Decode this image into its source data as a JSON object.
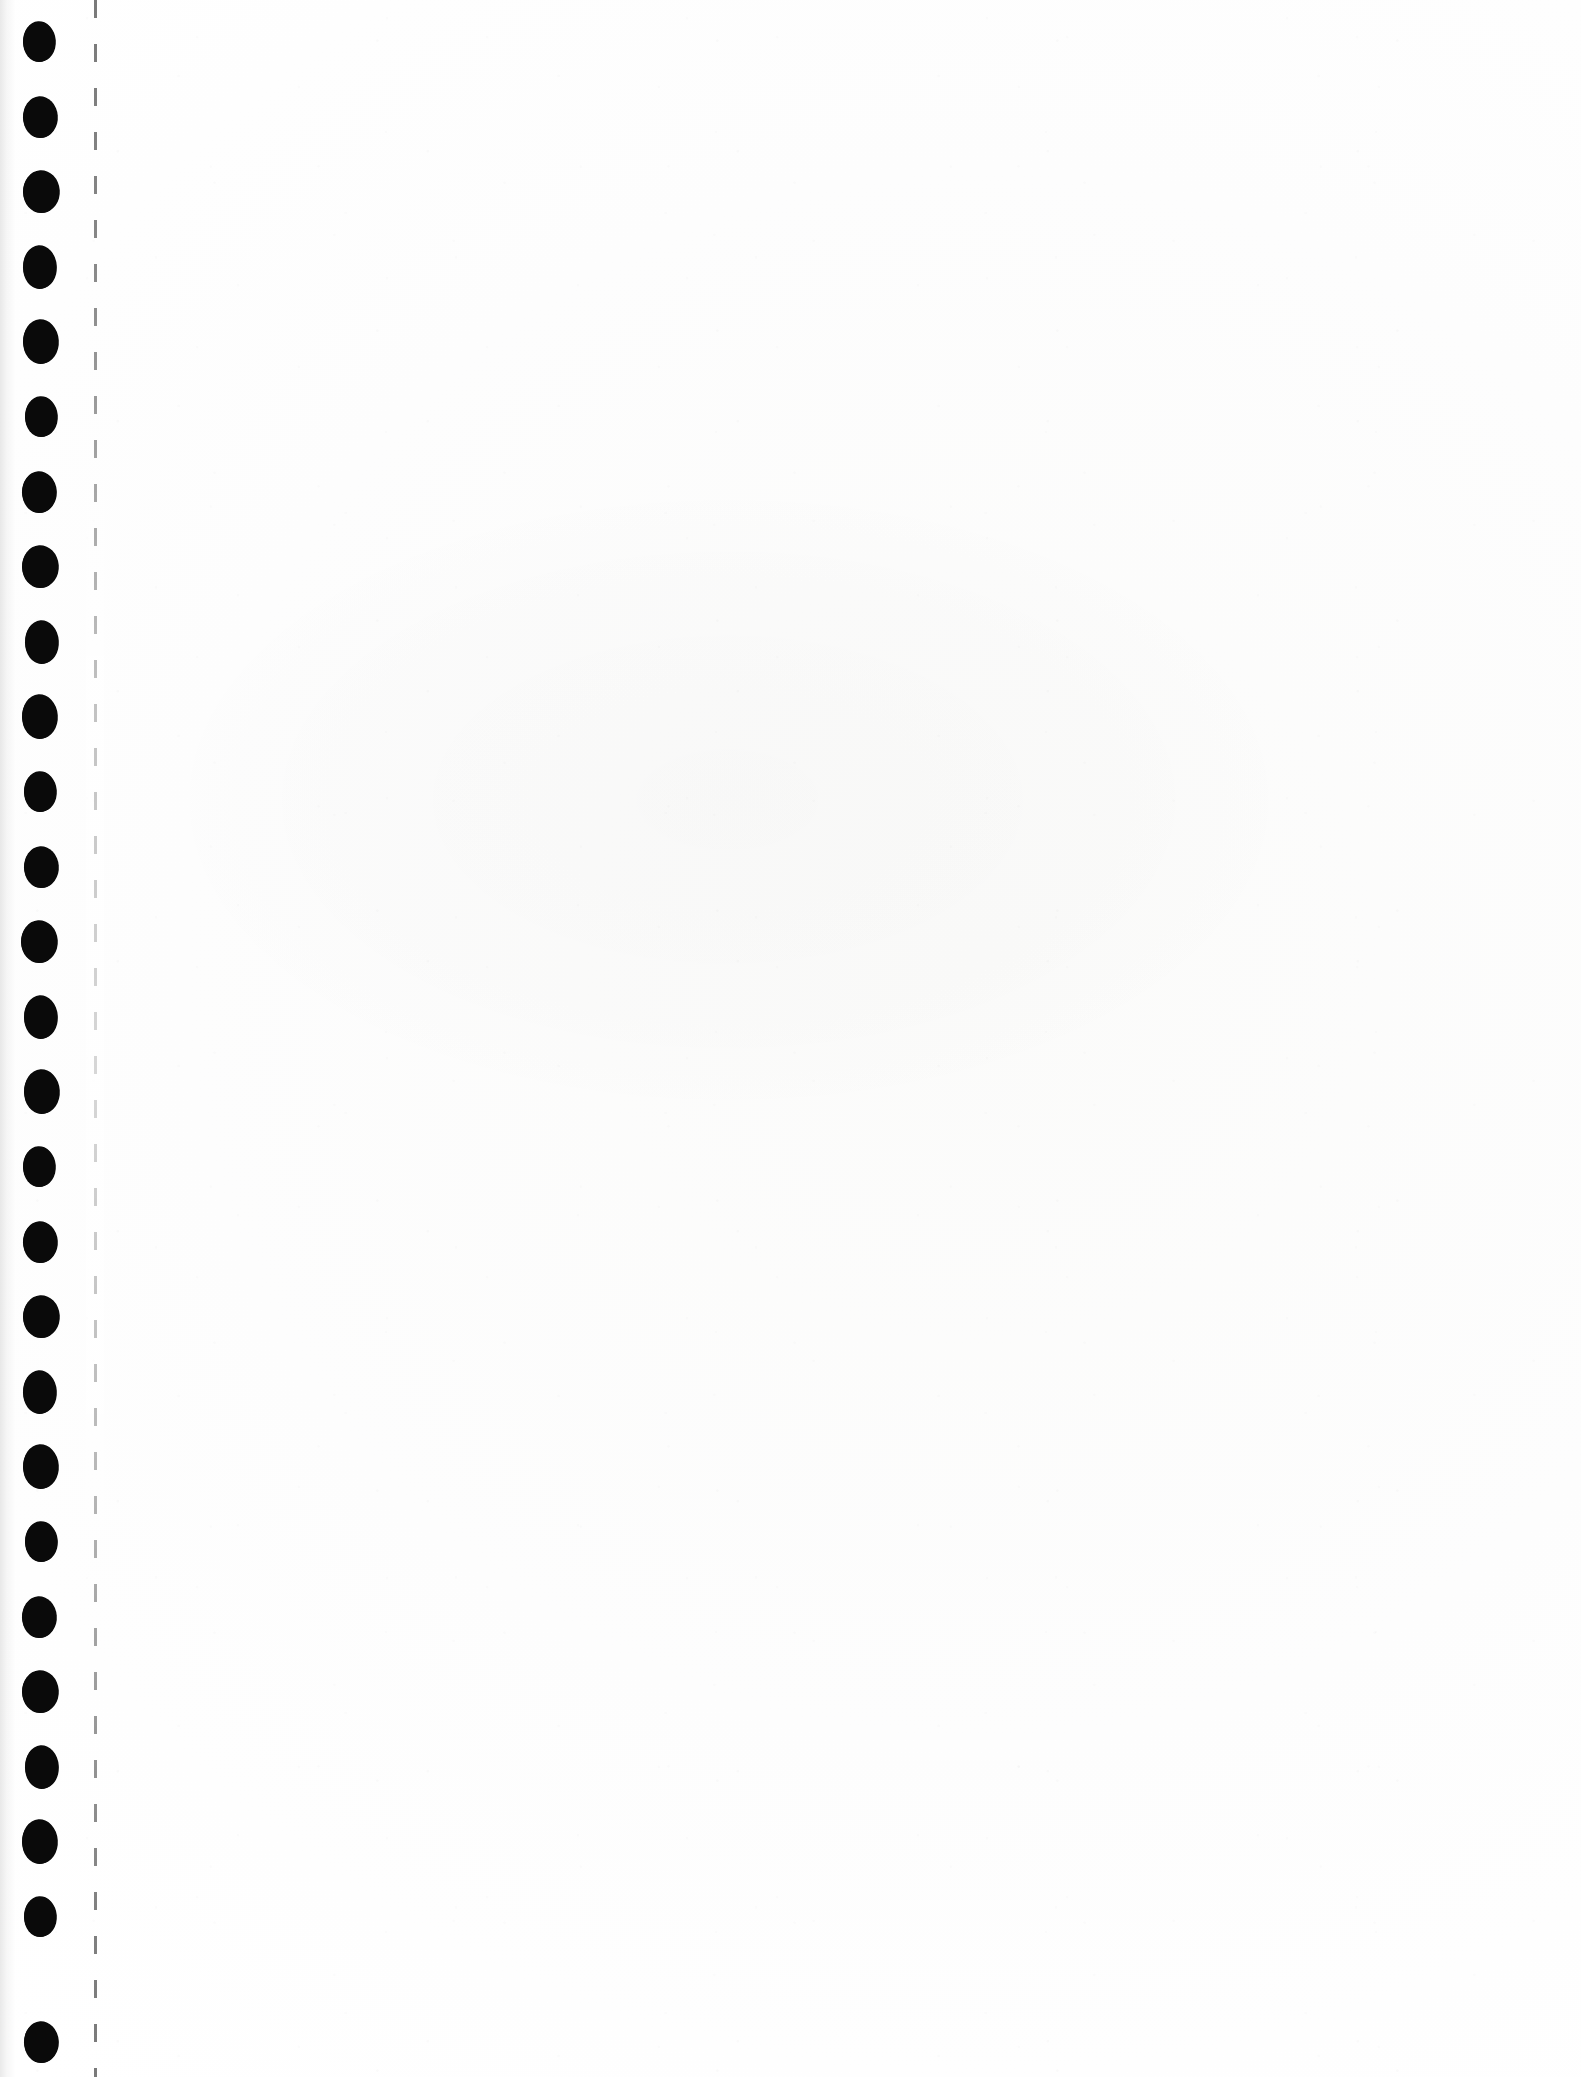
{
  "page": {
    "kind": "scanned-document",
    "width_px": 1581,
    "height_px": 2077,
    "paper_color": "#fdfdfd",
    "ink_color": "#080808",
    "visible_text": "",
    "writing_area_text": ""
  },
  "binding": {
    "edge": "left",
    "hole_shape": "circle",
    "hole_color": "#080808",
    "hole_count": 27,
    "hole_diameter_px": 34,
    "hole_center_x_px": 40,
    "first_hole_center_y_px": 42,
    "hole_pitch_y_px": 75,
    "hole_centers_y_px": [
      42,
      117,
      192,
      267,
      342,
      417,
      492,
      567,
      642,
      717,
      792,
      867,
      942,
      1017,
      1092,
      1167,
      1242,
      1317,
      1392,
      1467,
      1542,
      1617,
      1692,
      1767,
      1842,
      1917,
      2042
    ]
  },
  "perforation": {
    "orientation": "vertical",
    "style": "dashed",
    "color": "#282828",
    "x_px": 94,
    "dash_length_px": 18,
    "gap_length_px": 26,
    "opacity": 0.62
  },
  "scan_artifacts": {
    "left_edge_shadow": true,
    "grain_noise": true,
    "mid_page_smudge": true
  }
}
